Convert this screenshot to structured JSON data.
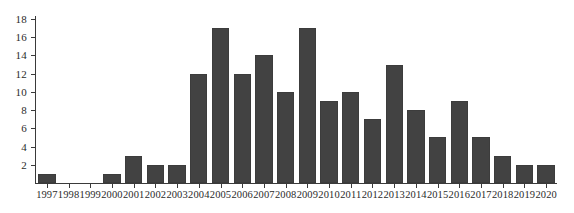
{
  "chart_data": {
    "type": "bar",
    "title": "",
    "subtitle": "",
    "xlabel": "",
    "ylabel": "",
    "categories": [
      "1997",
      "1998",
      "1999",
      "2000",
      "2001",
      "2002",
      "2003",
      "2004",
      "2005",
      "2006",
      "2007",
      "2008",
      "2009",
      "2010",
      "2011",
      "2012",
      "2013",
      "2014",
      "2015",
      "2016",
      "2017",
      "2018",
      "2019",
      "2020"
    ],
    "values": [
      1,
      0,
      0,
      1,
      3,
      2,
      2,
      12,
      17,
      12,
      14,
      10,
      17,
      9,
      10,
      7,
      13,
      8,
      5,
      9,
      5,
      3,
      2,
      2
    ],
    "ylim": [
      0,
      18
    ],
    "ytick_labels": [
      "2",
      "4",
      "6",
      "8",
      "10",
      "12",
      "14",
      "16",
      "18"
    ],
    "ytick_values": [
      2,
      4,
      6,
      8,
      10,
      12,
      14,
      16,
      18
    ],
    "grid": false,
    "legend": null,
    "legend_position": "none",
    "bar_color": "#424242",
    "axis_color": "#3a3a3a",
    "background_color": "#ffffff"
  }
}
